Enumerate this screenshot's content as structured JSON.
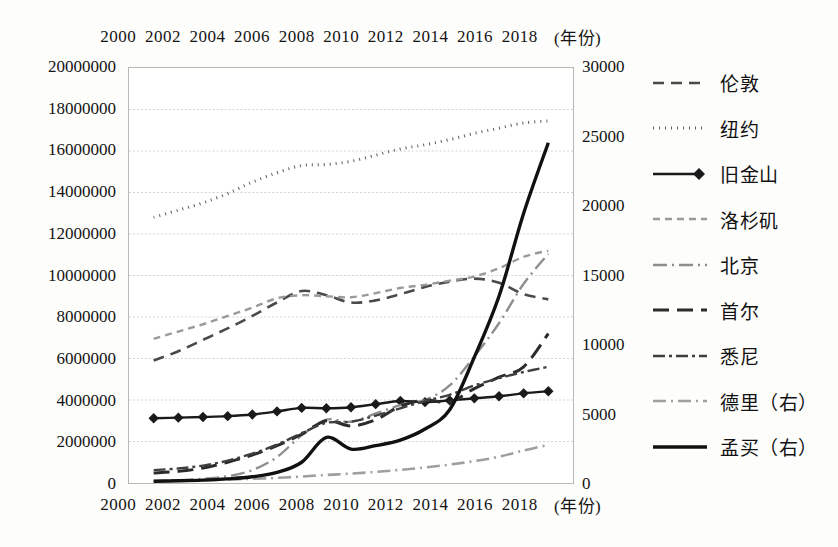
{
  "chart_data": {
    "type": "line",
    "title": "",
    "xlabel": "(年份)",
    "ylabel": "",
    "x": [
      2001,
      2002,
      2003,
      2004,
      2005,
      2006,
      2007,
      2008,
      2009,
      2010,
      2011,
      2012,
      2013,
      2014,
      2015,
      2016,
      2017
    ],
    "xticks": [
      "2000",
      "2002",
      "2004",
      "2006",
      "2008",
      "2010",
      "2012",
      "2014",
      "2016",
      "2018"
    ],
    "xlim": [
      2000,
      2018
    ],
    "ylim": [
      0,
      20000000
    ],
    "yticks": [
      "0",
      "2000000",
      "4000000",
      "6000000",
      "8000000",
      "10000000",
      "12000000",
      "14000000",
      "16000000",
      "18000000",
      "20000000"
    ],
    "ylim_right": [
      0,
      30000
    ],
    "yticks_right": [
      "0",
      "5000",
      "10000",
      "15000",
      "20000",
      "25000",
      "30000"
    ],
    "axis_top_unit": "(年份)",
    "axis_bottom_unit": "(年份)",
    "grid": true,
    "legend_position": "right",
    "series": [
      {
        "name": "伦敦",
        "axis": "left",
        "style": "dashed",
        "color": "#4a4a4a",
        "width": 2.6,
        "dash": "11,7",
        "marker": "none",
        "values": [
          5900000,
          6350000,
          6900000,
          7450000,
          8050000,
          8700000,
          9250000,
          9050000,
          8700000,
          8800000,
          9100000,
          9450000,
          9700000,
          9850000,
          9650000,
          9100000,
          8850000
        ]
      },
      {
        "name": "纽约",
        "axis": "left",
        "style": "dotted",
        "color": "#5c5c5c",
        "width": 3.0,
        "dash": "1,5",
        "marker": "none",
        "values": [
          12800000,
          13150000,
          13500000,
          13950000,
          14500000,
          14950000,
          15300000,
          15350000,
          15500000,
          15800000,
          16100000,
          16300000,
          16550000,
          16850000,
          17100000,
          17350000,
          17450000
        ]
      },
      {
        "name": "旧金山",
        "axis": "left",
        "style": "solid-diamond",
        "color": "#1a1a1a",
        "width": 2.4,
        "dash": "none",
        "marker": "diamond",
        "values": [
          3120000,
          3150000,
          3180000,
          3220000,
          3300000,
          3450000,
          3620000,
          3600000,
          3650000,
          3800000,
          3950000,
          3900000,
          3980000,
          4080000,
          4180000,
          4320000,
          4420000
        ]
      },
      {
        "name": "洛杉矶",
        "axis": "left",
        "style": "short-dash",
        "color": "#9a9a9a",
        "width": 2.4,
        "dash": "7,5",
        "marker": "none",
        "values": [
          6950000,
          7300000,
          7650000,
          8050000,
          8450000,
          8900000,
          9050000,
          9000000,
          8950000,
          9150000,
          9400000,
          9550000,
          9750000,
          9950000,
          10350000,
          10900000,
          11200000
        ]
      },
      {
        "name": "北京",
        "axis": "left",
        "style": "dash-dot",
        "color": "#8e8e8e",
        "width": 2.4,
        "dash": "14,5,2,5",
        "marker": "none",
        "values": [
          90000,
          130000,
          200000,
          330000,
          620000,
          1250000,
          2300000,
          3050000,
          2950000,
          3350000,
          3750000,
          4000000,
          4700000,
          6100000,
          7700000,
          9600000,
          11050000
        ]
      },
      {
        "name": "首尔",
        "axis": "left",
        "style": "long-dash",
        "color": "#2b2b2b",
        "width": 3.0,
        "dash": "16,8",
        "marker": "none",
        "values": [
          480000,
          560000,
          720000,
          1000000,
          1350000,
          1800000,
          2350000,
          3000000,
          2750000,
          3050000,
          3700000,
          4000000,
          3900000,
          4550000,
          5100000,
          5600000,
          7200000
        ]
      },
      {
        "name": "悉尼",
        "axis": "left",
        "style": "dash-dot-dash",
        "color": "#3f3f3f",
        "width": 2.4,
        "dash": "12,4,3,4",
        "marker": "none",
        "values": [
          620000,
          700000,
          840000,
          1080000,
          1420000,
          1850000,
          2400000,
          2900000,
          2950000,
          3250000,
          3600000,
          3950000,
          4250000,
          4700000,
          5050000,
          5350000,
          5600000
        ]
      },
      {
        "name": "德里（右）",
        "axis": "right",
        "style": "light-dash-dot",
        "color": "#9f9f9f",
        "width": 2.6,
        "dash": "13,5,2,5",
        "marker": "none",
        "values": [
          150,
          180,
          210,
          250,
          300,
          370,
          470,
          580,
          680,
          800,
          950,
          1120,
          1330,
          1580,
          1900,
          2350,
          2750
        ]
      },
      {
        "name": "孟买（右）",
        "axis": "right",
        "style": "solid-thick",
        "color": "#111111",
        "width": 3.4,
        "dash": "none",
        "marker": "none",
        "values": [
          130,
          160,
          210,
          300,
          450,
          760,
          1500,
          3300,
          2450,
          2700,
          3100,
          3900,
          5300,
          9100,
          13500,
          19500,
          24600
        ]
      }
    ]
  },
  "legend": {
    "items": [
      {
        "label": "伦敦"
      },
      {
        "label": "纽约"
      },
      {
        "label": "旧金山"
      },
      {
        "label": "洛杉矶"
      },
      {
        "label": "北京"
      },
      {
        "label": "首尔"
      },
      {
        "label": "悉尼"
      },
      {
        "label": "德里（右）"
      },
      {
        "label": "孟买（右）"
      }
    ]
  }
}
